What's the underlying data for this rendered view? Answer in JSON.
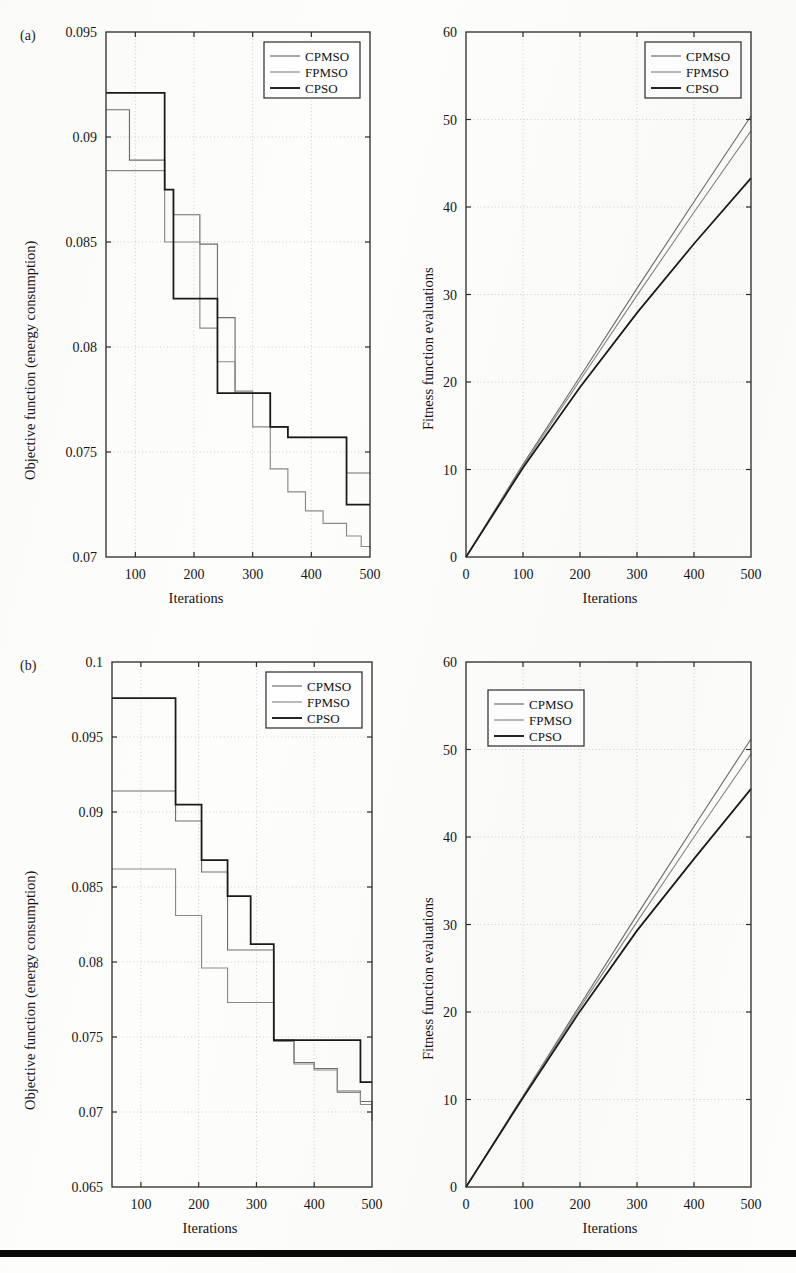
{
  "figure": {
    "panel_a_tag": "(a)",
    "panel_b_tag": "(b)",
    "series_names": [
      "CPMSO",
      "FPMSO",
      "CPSO"
    ],
    "series_colors": [
      "#6e6e6e",
      "#8a8a8a",
      "#1a1a1a"
    ],
    "bottom_rule_color": "#0a0a0a"
  },
  "chart_data": [
    {
      "id": "panel-a-objective",
      "panel": "(a)",
      "type": "line",
      "title": "",
      "xlabel": "Iterations",
      "ylabel": "Objective function (energy consumption)",
      "xlim": [
        50,
        500
      ],
      "ylim": [
        0.07,
        0.095
      ],
      "xticks": [
        100,
        200,
        300,
        400,
        500
      ],
      "yticks": [
        0.07,
        0.075,
        0.08,
        0.085,
        0.09,
        0.095
      ],
      "ytick_labels": [
        "0.07",
        "0.075",
        "0.08",
        "0.085",
        "0.09",
        "0.095"
      ],
      "xtick_labels": [
        "100",
        "200",
        "300",
        "400",
        "500"
      ],
      "grid": true,
      "step": "post",
      "legend_position": "top-right",
      "legend_entries": [
        "CPMSO",
        "FPMSO",
        "CPSO"
      ],
      "series": [
        {
          "name": "CPMSO",
          "color": "#6e6e6e",
          "x": [
            50,
            90,
            125,
            150,
            165,
            210,
            240,
            270,
            300,
            330,
            360,
            390,
            420,
            460,
            500
          ],
          "values": [
            0.0913,
            0.0889,
            0.0889,
            0.0875,
            0.0863,
            0.0849,
            0.0814,
            0.0778,
            0.0778,
            0.0762,
            0.0757,
            0.0757,
            0.0757,
            0.074,
            0.074
          ]
        },
        {
          "name": "FPMSO",
          "color": "#8a8a8a",
          "x": [
            50,
            125,
            150,
            165,
            210,
            240,
            270,
            300,
            330,
            360,
            390,
            420,
            460,
            485,
            500
          ],
          "values": [
            0.0884,
            0.0884,
            0.085,
            0.085,
            0.0809,
            0.0793,
            0.0779,
            0.0762,
            0.0742,
            0.0731,
            0.0722,
            0.0716,
            0.071,
            0.0705,
            0.0704
          ]
        },
        {
          "name": "CPSO",
          "color": "#1a1a1a",
          "x": [
            50,
            125,
            150,
            165,
            210,
            240,
            270,
            300,
            330,
            360,
            390,
            420,
            460,
            500
          ],
          "values": [
            0.0921,
            0.0921,
            0.0875,
            0.0823,
            0.0823,
            0.0778,
            0.0778,
            0.0778,
            0.0762,
            0.0757,
            0.0757,
            0.0757,
            0.0725,
            0.0725
          ]
        }
      ]
    },
    {
      "id": "panel-a-fitness",
      "panel": "(a)",
      "type": "line",
      "title": "",
      "xlabel": "Iterations",
      "ylabel": "Fitness function evaluations",
      "xlim": [
        0,
        500
      ],
      "ylim": [
        0,
        60
      ],
      "xticks": [
        0,
        100,
        200,
        300,
        400,
        500
      ],
      "yticks": [
        0,
        10,
        20,
        30,
        40,
        50,
        60
      ],
      "ytick_labels": [
        "0",
        "10",
        "20",
        "30",
        "40",
        "50",
        "60"
      ],
      "xtick_labels": [
        "0",
        "100",
        "200",
        "300",
        "400",
        "500"
      ],
      "grid": true,
      "legend_position": "top-right",
      "legend_entries": [
        "CPMSO",
        "FPMSO",
        "CPSO"
      ],
      "series": [
        {
          "name": "CPMSO",
          "color": "#6e6e6e",
          "x": [
            0,
            100,
            200,
            300,
            400,
            500
          ],
          "values": [
            0,
            10.6,
            20.6,
            30.7,
            40.6,
            50.4
          ]
        },
        {
          "name": "FPMSO",
          "color": "#8a8a8a",
          "x": [
            0,
            100,
            200,
            300,
            400,
            500
          ],
          "values": [
            0,
            10.4,
            20.2,
            29.9,
            39.4,
            48.7
          ]
        },
        {
          "name": "CPSO",
          "color": "#1a1a1a",
          "x": [
            0,
            100,
            200,
            300,
            400,
            500
          ],
          "values": [
            0,
            10.2,
            19.4,
            27.9,
            35.8,
            43.3
          ]
        }
      ]
    },
    {
      "id": "panel-b-objective",
      "panel": "(b)",
      "type": "line",
      "title": "",
      "xlabel": "Iterations",
      "ylabel": "Objective function (energy consumption)",
      "xlim": [
        50,
        500
      ],
      "ylim": [
        0.065,
        0.1
      ],
      "xticks": [
        100,
        200,
        300,
        400,
        500
      ],
      "yticks": [
        0.065,
        0.07,
        0.075,
        0.08,
        0.085,
        0.09,
        0.095,
        0.1
      ],
      "ytick_labels": [
        "0.065",
        "0.07",
        "0.075",
        "0.08",
        "0.085",
        "0.09",
        "0.095",
        "0.1"
      ],
      "xtick_labels": [
        "100",
        "200",
        "300",
        "400",
        "500"
      ],
      "grid": true,
      "step": "post",
      "legend_position": "top-right",
      "legend_entries": [
        "CPMSO",
        "FPMSO",
        "CPSO"
      ],
      "series": [
        {
          "name": "CPMSO",
          "color": "#6e6e6e",
          "x": [
            50,
            125,
            160,
            205,
            250,
            290,
            330,
            365,
            400,
            440,
            480,
            500
          ],
          "values": [
            0.0914,
            0.0914,
            0.0894,
            0.086,
            0.0808,
            0.0808,
            0.0748,
            0.0733,
            0.0729,
            0.0714,
            0.0707,
            0.0702
          ]
        },
        {
          "name": "FPMSO",
          "color": "#8a8a8a",
          "x": [
            50,
            125,
            160,
            205,
            250,
            290,
            330,
            365,
            400,
            440,
            480,
            500
          ],
          "values": [
            0.0862,
            0.0862,
            0.0831,
            0.0796,
            0.0773,
            0.0773,
            0.0747,
            0.0732,
            0.0728,
            0.0713,
            0.0705,
            0.0694
          ]
        },
        {
          "name": "CPSO",
          "color": "#1a1a1a",
          "x": [
            50,
            125,
            160,
            205,
            250,
            290,
            330,
            365,
            400,
            440,
            480,
            500
          ],
          "values": [
            0.0976,
            0.0976,
            0.0905,
            0.0868,
            0.0844,
            0.0812,
            0.0748,
            0.0748,
            0.0748,
            0.0748,
            0.072,
            0.072
          ]
        }
      ]
    },
    {
      "id": "panel-b-fitness",
      "panel": "(b)",
      "type": "line",
      "title": "",
      "xlabel": "Iterations",
      "ylabel": "Fitness function evaluations",
      "xlim": [
        0,
        500
      ],
      "ylim": [
        0,
        60
      ],
      "xticks": [
        0,
        100,
        200,
        300,
        400,
        500
      ],
      "yticks": [
        0,
        10,
        20,
        30,
        40,
        50,
        60
      ],
      "ytick_labels": [
        "0",
        "10",
        "20",
        "30",
        "40",
        "50",
        "60"
      ],
      "xtick_labels": [
        "0",
        "100",
        "200",
        "300",
        "400",
        "500"
      ],
      "grid": true,
      "legend_position": "top-left",
      "legend_entries": [
        "CPMSO",
        "FPMSO",
        "CPSO"
      ],
      "series": [
        {
          "name": "CPMSO",
          "color": "#6e6e6e",
          "x": [
            0,
            100,
            200,
            300,
            400,
            500
          ],
          "values": [
            0,
            10.4,
            20.8,
            31.1,
            41.2,
            51.2
          ]
        },
        {
          "name": "FPMSO",
          "color": "#8a8a8a",
          "x": [
            0,
            100,
            200,
            300,
            400,
            500
          ],
          "values": [
            0,
            10.3,
            20.5,
            30.3,
            40.0,
            49.5
          ]
        },
        {
          "name": "CPSO",
          "color": "#1a1a1a",
          "x": [
            0,
            100,
            200,
            300,
            400,
            500
          ],
          "values": [
            0,
            10.2,
            20.1,
            29.3,
            37.5,
            45.5
          ]
        }
      ]
    }
  ]
}
